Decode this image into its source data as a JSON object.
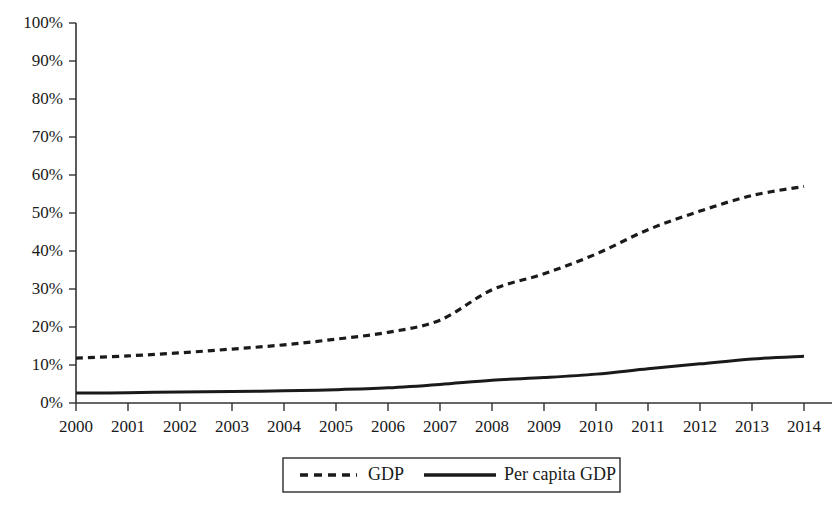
{
  "chart_data": {
    "type": "line",
    "title": "",
    "subtitle": "",
    "xlabel": "",
    "ylabel": "",
    "categories": [
      "2000",
      "2001",
      "2002",
      "2003",
      "2004",
      "2005",
      "2006",
      "2007",
      "2008",
      "2009",
      "2010",
      "2011",
      "2012",
      "2013",
      "2014"
    ],
    "x": [
      2000,
      2001,
      2002,
      2003,
      2004,
      2005,
      2006,
      2007,
      2008,
      2009,
      2010,
      2011,
      2012,
      2013,
      2014
    ],
    "xlim": [
      2000,
      2014
    ],
    "ylim": [
      0,
      100
    ],
    "ytick_labels": [
      "0%",
      "10%",
      "20%",
      "30%",
      "40%",
      "50%",
      "60%",
      "70%",
      "80%",
      "90%",
      "100%"
    ],
    "ytick_values": [
      0,
      10,
      20,
      30,
      40,
      50,
      60,
      70,
      80,
      90,
      100
    ],
    "grid": false,
    "legend_position": "bottom",
    "units": "percent",
    "series": [
      {
        "name": "GDP",
        "style": "dashed",
        "color": "#1a1a1a",
        "values": [
          11.8,
          12.4,
          13.2,
          14.2,
          15.3,
          16.8,
          18.6,
          21.8,
          29.8,
          34.0,
          39.2,
          45.6,
          50.5,
          54.6,
          57.0
        ]
      },
      {
        "name": "Per capita GDP",
        "style": "solid",
        "color": "#1a1a1a",
        "values": [
          2.6,
          2.7,
          2.9,
          3.0,
          3.2,
          3.5,
          4.0,
          4.9,
          6.0,
          6.7,
          7.6,
          9.0,
          10.3,
          11.6,
          12.3
        ]
      }
    ]
  },
  "legend": {
    "items": [
      {
        "label": "GDP",
        "style": "dashed"
      },
      {
        "label": "Per capita GDP",
        "style": "solid"
      }
    ]
  }
}
